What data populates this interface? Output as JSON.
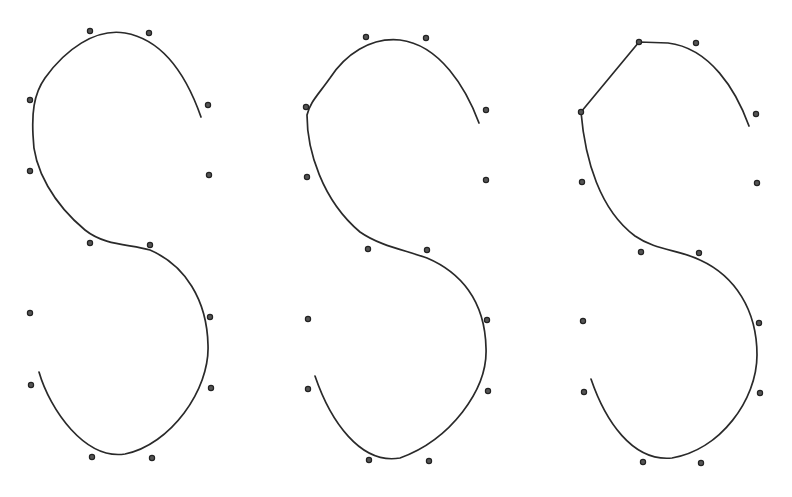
{
  "figure": {
    "panels": [
      {
        "id": "left",
        "control_points": [
          [
            90,
            31
          ],
          [
            149,
            33
          ],
          [
            30,
            100
          ],
          [
            208,
            105
          ],
          [
            30,
            171
          ],
          [
            209,
            175
          ],
          [
            90,
            243
          ],
          [
            150,
            245
          ],
          [
            30,
            313
          ],
          [
            210,
            317
          ],
          [
            31,
            385
          ],
          [
            211,
            388
          ],
          [
            92,
            457
          ],
          [
            152,
            458
          ]
        ],
        "curve_path": "M201,117 C188,80 165,40 125,33 C95,28 65,50 45,78 C33,95 32,115 33,135 C33,170 55,205 85,230 C105,246 130,244 150,250 C185,265 207,300 208,345 C210,390 170,445 125,454 C85,460 50,410 39,372"
      },
      {
        "id": "middle",
        "control_points": [
          [
            366,
            37
          ],
          [
            426,
            38
          ],
          [
            306,
            107
          ],
          [
            486,
            110
          ],
          [
            307,
            177
          ],
          [
            486,
            180
          ],
          [
            368,
            249
          ],
          [
            427,
            250
          ],
          [
            308,
            319
          ],
          [
            487,
            320
          ],
          [
            308,
            389
          ],
          [
            488,
            391
          ],
          [
            369,
            460
          ],
          [
            429,
            461
          ]
        ],
        "curve_path": "M479,123 C466,88 440,45 400,40 C370,37 345,55 330,78 C318,95 310,102 307,115 C307,150 322,200 360,232 C380,246 405,250 427,258 C460,272 485,300 486,348 C488,390 450,440 400,458 C360,465 330,420 315,376"
      },
      {
        "id": "right",
        "control_points": [
          [
            639,
            42
          ],
          [
            696,
            43
          ],
          [
            581,
            112
          ],
          [
            756,
            114
          ],
          [
            582,
            182
          ],
          [
            757,
            183
          ],
          [
            641,
            252
          ],
          [
            699,
            253
          ],
          [
            583,
            321
          ],
          [
            759,
            323
          ],
          [
            584,
            392
          ],
          [
            760,
            393
          ],
          [
            643,
            462
          ],
          [
            701,
            463
          ]
        ],
        "curve_path": "M749,126 C736,90 710,48 668,43 L639,42 L581,112 C585,160 600,210 635,236 C655,250 680,250 700,260 C735,276 757,310 757,355 C757,400 720,450 672,458 C632,462 605,420 591,379"
      }
    ]
  },
  "colors": {
    "stroke": "#2a2a2a",
    "point": "#555555",
    "background": "#ffffff"
  }
}
